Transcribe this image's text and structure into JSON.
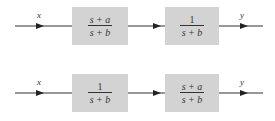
{
  "diagrams": [
    {
      "input_label": "x",
      "output_label": "y",
      "blocks": [
        {
          "numerator": "s + a",
          "denominator": "s + b"
        },
        {
          "numerator": "1",
          "denominator": "s + b"
        }
      ]
    },
    {
      "input_label": "x",
      "output_label": "y",
      "blocks": [
        {
          "numerator": "1",
          "denominator": "s + b"
        },
        {
          "numerator": "s + a",
          "denominator": "s + b"
        }
      ]
    }
  ],
  "colors": {
    "block_fill": "#d3d3d3",
    "line": "#333333"
  }
}
